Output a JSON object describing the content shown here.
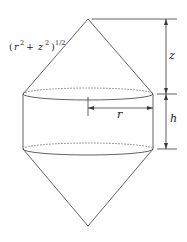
{
  "diagram": {
    "labels": {
      "slant": {
        "open": "(",
        "r": "r",
        "r_exp": "2",
        "plus": " + ",
        "z": "z",
        "z_exp": "2",
        "close": ")",
        "outer_exp": "1/2"
      },
      "z": "z",
      "h": "h",
      "r": "r"
    },
    "colors": {
      "line": "#3a3a3a",
      "background": "#ffffff",
      "text": "#222222"
    },
    "geometry": {
      "top_apex": [
        88,
        19
      ],
      "bottom_apex": [
        88,
        226
      ],
      "cylinder_top_y": 94,
      "cylinder_bottom_y": 149,
      "cylinder_left_x": 23,
      "cylinder_right_x": 153,
      "dimension_x": 166
    }
  }
}
